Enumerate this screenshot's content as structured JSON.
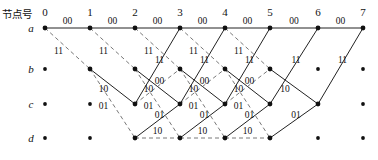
{
  "figure": {
    "kind": "trellis-diagram",
    "header_label": "节点号",
    "row_labels": [
      "a",
      "b",
      "c",
      "d"
    ],
    "column_numbers": [
      "0",
      "1",
      "2",
      "3",
      "4",
      "5",
      "6",
      "7"
    ],
    "solid_color": "#222222",
    "dashed_color": "#555555",
    "node_color": "#111111",
    "columns_x": [
      45,
      90,
      135,
      180,
      225,
      270,
      318,
      363
    ],
    "rows_y": [
      28,
      69,
      104,
      138
    ]
  },
  "chart_data": {
    "type": "diagram",
    "title": "节点号",
    "xlabel": "",
    "ylabel": "",
    "categories": [
      "0",
      "1",
      "2",
      "3",
      "4",
      "5",
      "6",
      "7"
    ],
    "states": [
      "a",
      "b",
      "c",
      "d"
    ],
    "nodes_active": [
      {
        "col": 0,
        "row": "a"
      },
      {
        "col": 1,
        "row": "a"
      },
      {
        "col": 1,
        "row": "b"
      },
      {
        "col": 2,
        "row": "a"
      },
      {
        "col": 2,
        "row": "b"
      },
      {
        "col": 2,
        "row": "c"
      },
      {
        "col": 2,
        "row": "d"
      },
      {
        "col": 3,
        "row": "a"
      },
      {
        "col": 3,
        "row": "b"
      },
      {
        "col": 3,
        "row": "c"
      },
      {
        "col": 3,
        "row": "d"
      },
      {
        "col": 4,
        "row": "a"
      },
      {
        "col": 4,
        "row": "b"
      },
      {
        "col": 4,
        "row": "c"
      },
      {
        "col": 4,
        "row": "d"
      },
      {
        "col": 5,
        "row": "a"
      },
      {
        "col": 5,
        "row": "b"
      },
      {
        "col": 5,
        "row": "c"
      },
      {
        "col": 5,
        "row": "d"
      },
      {
        "col": 6,
        "row": "a"
      },
      {
        "col": 6,
        "row": "c"
      },
      {
        "col": 7,
        "row": "a"
      }
    ],
    "nodes_inactive": [
      {
        "col": 0,
        "row": "b"
      },
      {
        "col": 0,
        "row": "c"
      },
      {
        "col": 0,
        "row": "d"
      },
      {
        "col": 1,
        "row": "c"
      },
      {
        "col": 1,
        "row": "d"
      },
      {
        "col": 6,
        "row": "b"
      },
      {
        "col": 6,
        "row": "d"
      },
      {
        "col": 7,
        "row": "b"
      },
      {
        "col": 7,
        "row": "c"
      },
      {
        "col": 7,
        "row": "d"
      }
    ],
    "edges": [
      {
        "from_col": 0,
        "from_row": "a",
        "to_col": 1,
        "to_row": "a",
        "style": "solid",
        "label": "00"
      },
      {
        "from_col": 0,
        "from_row": "a",
        "to_col": 1,
        "to_row": "b",
        "style": "dashed",
        "label": "11"
      },
      {
        "from_col": 1,
        "from_row": "a",
        "to_col": 2,
        "to_row": "a",
        "style": "solid",
        "label": "00"
      },
      {
        "from_col": 1,
        "from_row": "a",
        "to_col": 2,
        "to_row": "b",
        "style": "dashed",
        "label": "11"
      },
      {
        "from_col": 1,
        "from_row": "b",
        "to_col": 2,
        "to_row": "c",
        "style": "solid",
        "label": "10"
      },
      {
        "from_col": 1,
        "from_row": "b",
        "to_col": 2,
        "to_row": "d",
        "style": "dashed",
        "label": "01"
      },
      {
        "from_col": 2,
        "from_row": "a",
        "to_col": 3,
        "to_row": "a",
        "style": "solid",
        "label": "00"
      },
      {
        "from_col": 2,
        "from_row": "a",
        "to_col": 3,
        "to_row": "b",
        "style": "dashed",
        "label": "11"
      },
      {
        "from_col": 2,
        "from_row": "b",
        "to_col": 3,
        "to_row": "c",
        "style": "solid",
        "label": "10"
      },
      {
        "from_col": 2,
        "from_row": "b",
        "to_col": 3,
        "to_row": "d",
        "style": "dashed",
        "label": "01"
      },
      {
        "from_col": 2,
        "from_row": "c",
        "to_col": 3,
        "to_row": "a",
        "style": "solid",
        "label": "11"
      },
      {
        "from_col": 2,
        "from_row": "c",
        "to_col": 3,
        "to_row": "b",
        "style": "dashed",
        "label": "00"
      },
      {
        "from_col": 2,
        "from_row": "d",
        "to_col": 3,
        "to_row": "c",
        "style": "solid",
        "label": "01"
      },
      {
        "from_col": 2,
        "from_row": "d",
        "to_col": 3,
        "to_row": "d",
        "style": "dashed",
        "label": "10"
      },
      {
        "from_col": 3,
        "from_row": "a",
        "to_col": 4,
        "to_row": "a",
        "style": "solid",
        "label": "00"
      },
      {
        "from_col": 3,
        "from_row": "a",
        "to_col": 4,
        "to_row": "b",
        "style": "dashed",
        "label": "11"
      },
      {
        "from_col": 3,
        "from_row": "b",
        "to_col": 4,
        "to_row": "c",
        "style": "solid",
        "label": "10"
      },
      {
        "from_col": 3,
        "from_row": "b",
        "to_col": 4,
        "to_row": "d",
        "style": "dashed",
        "label": "01"
      },
      {
        "from_col": 3,
        "from_row": "c",
        "to_col": 4,
        "to_row": "a",
        "style": "solid",
        "label": "11"
      },
      {
        "from_col": 3,
        "from_row": "c",
        "to_col": 4,
        "to_row": "b",
        "style": "dashed",
        "label": "00"
      },
      {
        "from_col": 3,
        "from_row": "d",
        "to_col": 4,
        "to_row": "c",
        "style": "solid",
        "label": "01"
      },
      {
        "from_col": 3,
        "from_row": "d",
        "to_col": 4,
        "to_row": "d",
        "style": "dashed",
        "label": "10"
      },
      {
        "from_col": 4,
        "from_row": "a",
        "to_col": 5,
        "to_row": "a",
        "style": "solid",
        "label": "00"
      },
      {
        "from_col": 4,
        "from_row": "a",
        "to_col": 5,
        "to_row": "b",
        "style": "dashed",
        "label": "11"
      },
      {
        "from_col": 4,
        "from_row": "b",
        "to_col": 5,
        "to_row": "c",
        "style": "solid",
        "label": "10"
      },
      {
        "from_col": 4,
        "from_row": "b",
        "to_col": 5,
        "to_row": "d",
        "style": "dashed",
        "label": "01"
      },
      {
        "from_col": 4,
        "from_row": "c",
        "to_col": 5,
        "to_row": "a",
        "style": "solid",
        "label": "11"
      },
      {
        "from_col": 4,
        "from_row": "c",
        "to_col": 5,
        "to_row": "b",
        "style": "dashed",
        "label": "00"
      },
      {
        "from_col": 4,
        "from_row": "d",
        "to_col": 5,
        "to_row": "c",
        "style": "solid",
        "label": "01"
      },
      {
        "from_col": 4,
        "from_row": "d",
        "to_col": 5,
        "to_row": "d",
        "style": "dashed",
        "label": "10"
      },
      {
        "from_col": 5,
        "from_row": "a",
        "to_col": 6,
        "to_row": "a",
        "style": "solid",
        "label": "00"
      },
      {
        "from_col": 5,
        "from_row": "b",
        "to_col": 6,
        "to_row": "c",
        "style": "solid",
        "label": "10"
      },
      {
        "from_col": 5,
        "from_row": "c",
        "to_col": 6,
        "to_row": "a",
        "style": "solid",
        "label": "11"
      },
      {
        "from_col": 5,
        "from_row": "d",
        "to_col": 6,
        "to_row": "c",
        "style": "solid",
        "label": "01"
      },
      {
        "from_col": 6,
        "from_row": "a",
        "to_col": 7,
        "to_row": "a",
        "style": "solid",
        "label": "00"
      },
      {
        "from_col": 6,
        "from_row": "c",
        "to_col": 7,
        "to_row": "a",
        "style": "solid",
        "label": "11"
      }
    ],
    "edge_labels_unique": [
      "00",
      "11",
      "10",
      "01"
    ],
    "legend": {
      "solid": "input 0",
      "dashed": "input 1"
    },
    "grid": false
  }
}
